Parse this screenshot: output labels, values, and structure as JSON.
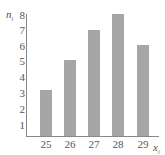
{
  "chart_data": {
    "type": "bar",
    "title": "",
    "xlabel": "x_i",
    "ylabel": "n_i",
    "categories": [
      "25",
      "26",
      "27",
      "28",
      "29"
    ],
    "values": [
      3,
      5,
      7,
      8,
      6
    ],
    "ylim": [
      0,
      8
    ],
    "yticks": [
      "1",
      "2",
      "3",
      "4",
      "5",
      "6",
      "7",
      "8"
    ],
    "grid": false,
    "legend": null,
    "bar_color": "#a6a6a6"
  },
  "labels": {
    "y_base": "n",
    "y_sub": "i",
    "x_base": "x",
    "x_sub": "i"
  }
}
